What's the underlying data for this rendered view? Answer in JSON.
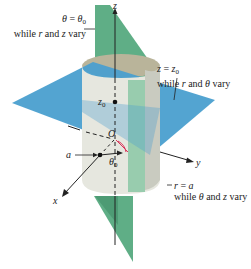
{
  "figure": {
    "type": "cylindrical-coordinates-surfaces",
    "colors": {
      "vertical_plane": "#5fae86",
      "vertical_plane_light": "#8fc9a8",
      "horizontal_plane": "#4a9fcf",
      "cylinder": "#e6e7df",
      "cylinder_shade": "#c9cbc0",
      "cylinder_inner": "#b9b49a",
      "axis": "#222222",
      "angle_arc": "#d9365a"
    },
    "axes": {
      "x": "x",
      "y": "y",
      "z": "z"
    },
    "labels": {
      "theta_plane": {
        "eq_lhs": "θ",
        "eq_op": " = ",
        "eq_rhs": "θ",
        "eq_rhs_sub": "0",
        "desc_pre": "while ",
        "desc_var1": "r",
        "desc_mid": " and ",
        "desc_var2": "z",
        "desc_post": " vary"
      },
      "z_plane": {
        "eq_lhs": "z",
        "eq_op": " = ",
        "eq_rhs": "z",
        "eq_rhs_sub": "0",
        "desc_pre": "while ",
        "desc_var1": "r",
        "desc_mid": " and ",
        "desc_var2": "θ",
        "desc_post": " vary"
      },
      "cylinder": {
        "eq_lhs": "r",
        "eq_op": " = ",
        "eq_rhs": "a",
        "desc_pre": "while ",
        "desc_var1": "θ",
        "desc_mid": " and ",
        "desc_var2": "z",
        "desc_post": " vary"
      },
      "z0_point": {
        "main": "z",
        "sub": "0"
      },
      "origin": "O",
      "radius": "a",
      "angle": {
        "main": "θ",
        "sub": "0"
      }
    }
  }
}
